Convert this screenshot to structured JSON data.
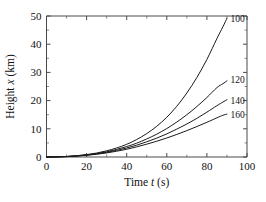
{
  "chart_data": {
    "type": "line",
    "title": "",
    "xlabel": "Time t (s)",
    "ylabel": "Height x (km)",
    "xlabel_parts": {
      "pre": "Time ",
      "italic": "t",
      "post": " (s)"
    },
    "ylabel_parts": {
      "pre": "Height ",
      "italic": "x",
      "post": " (km)"
    },
    "xlim": [
      0,
      100
    ],
    "ylim": [
      0,
      50
    ],
    "xticks": [
      0,
      20,
      40,
      60,
      80,
      100
    ],
    "yticks": [
      0,
      10,
      20,
      30,
      40,
      50
    ],
    "xtick_labels": [
      "0",
      "20",
      "40",
      "60",
      "80",
      "100"
    ],
    "ytick_labels": [
      "0",
      "10",
      "20",
      "30",
      "40",
      "50"
    ],
    "x_minor_step": 10,
    "y_minor_step": 5,
    "grid": false,
    "legend_position": "inline-right-of-curve-ends",
    "x_units": "s",
    "y_units": "km",
    "series": [
      {
        "name": "100",
        "label": "100",
        "label_x": 90,
        "label_y": 49,
        "x": [
          0,
          5,
          10,
          15,
          20,
          25,
          30,
          35,
          40,
          45,
          50,
          55,
          60,
          65,
          70,
          75,
          80,
          85,
          88,
          90
        ],
        "values": [
          0.0,
          0.05,
          0.2,
          0.45,
          0.85,
          1.4,
          2.2,
          3.2,
          4.5,
          6.2,
          8.3,
          10.9,
          14.1,
          18.0,
          22.7,
          28.2,
          34.6,
          42.0,
          46.2,
          49.2
        ]
      },
      {
        "name": "120",
        "label": "120",
        "label_x": 90,
        "label_y": 27.5,
        "x": [
          0,
          5,
          10,
          15,
          20,
          25,
          30,
          35,
          40,
          45,
          50,
          55,
          60,
          65,
          70,
          75,
          80,
          85,
          88,
          90
        ],
        "values": [
          0.0,
          0.04,
          0.17,
          0.4,
          0.75,
          1.2,
          1.85,
          2.7,
          3.7,
          4.9,
          6.4,
          8.1,
          10.1,
          12.4,
          15.0,
          17.9,
          21.1,
          24.6,
          26.0,
          27.0
        ]
      },
      {
        "name": "140",
        "label": "140",
        "label_x": 90,
        "label_y": 20.2,
        "x": [
          0,
          5,
          10,
          15,
          20,
          25,
          30,
          35,
          40,
          45,
          50,
          55,
          60,
          65,
          70,
          75,
          80,
          85,
          88,
          90
        ],
        "values": [
          0.0,
          0.04,
          0.15,
          0.36,
          0.68,
          1.1,
          1.65,
          2.35,
          3.2,
          4.2,
          5.4,
          6.7,
          8.2,
          9.9,
          11.7,
          13.7,
          15.9,
          18.2,
          19.5,
          20.3
        ]
      },
      {
        "name": "160",
        "label": "160",
        "label_x": 90,
        "label_y": 15.0,
        "x": [
          0,
          5,
          10,
          15,
          20,
          25,
          30,
          35,
          40,
          45,
          50,
          55,
          60,
          65,
          70,
          75,
          80,
          85,
          88,
          90
        ],
        "values": [
          0.0,
          0.03,
          0.13,
          0.32,
          0.6,
          0.97,
          1.45,
          2.05,
          2.75,
          3.6,
          4.55,
          5.6,
          6.75,
          8.0,
          9.35,
          10.8,
          12.3,
          13.9,
          14.8,
          15.2
        ]
      }
    ],
    "colors": {
      "curve": "#1a1a1a",
      "axis": "#4a4a4a",
      "text": "#111111",
      "background": "#ffffff"
    }
  }
}
